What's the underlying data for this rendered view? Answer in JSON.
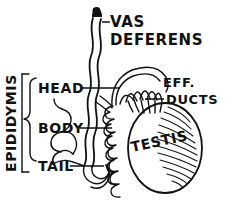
{
  "figure": {
    "style": "black ink line art on white",
    "ink_color": "#111111",
    "background_color": "#ffffff"
  },
  "labels": {
    "vas_deferens_line1": "VAS",
    "vas_deferens_line2": "DEFERENS",
    "epididymis": "EPIDIDYMIS",
    "head": "HEAD",
    "body": "BODY",
    "tail": "TAIL",
    "eff_line1": "EFF.",
    "eff_line2": "DUCTS",
    "testis": "TESTIS"
  },
  "structures": {
    "vas_deferens": "wavy vertical double-line duct with dark rounded cap at top",
    "epididymis_head": "upper coiled region receiving efferent ducts",
    "epididymis_body": "tightly coiled spring-like tube middle region",
    "epididymis_tail": "looping duct at lower end turning upward into vas deferens",
    "efferent_ducts": "fan of looping ductules arcing from testis into epididymis head",
    "testis": "large oval body with curved diagonal hatch shading on right side"
  }
}
